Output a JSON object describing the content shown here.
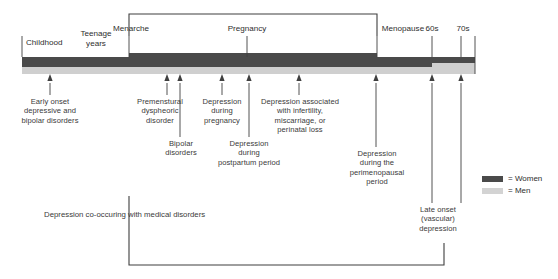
{
  "figure": {
    "colors": {
      "women": "#4a4a4a",
      "men": "#cfcfcf",
      "line": "#3f3f3f",
      "text": "#3a3a3a"
    }
  },
  "stages": [
    {
      "label": "Childhood",
      "x": 50,
      "y": 38,
      "align": "left",
      "tick": false
    },
    {
      "label": "Teenage\nyears",
      "x": 96,
      "y": 28,
      "align": "center",
      "tick": false
    },
    {
      "label": "Menarche",
      "x": 129,
      "y": 24,
      "align": "center",
      "tick": true
    },
    {
      "label": "Pregnancy",
      "x": 247,
      "y": 24,
      "align": "center",
      "tick": true
    },
    {
      "label": "Menopause",
      "x": 377,
      "y": 24,
      "align": "center",
      "tick": true
    },
    {
      "label": "60s",
      "x": 432,
      "y": 24,
      "align": "center",
      "tick": true
    },
    {
      "label": "70s",
      "x": 461,
      "y": 24,
      "align": "center",
      "tick": true
    }
  ],
  "annotations": [
    {
      "text": "Early onset\ndepressive and\nbipolar disorders",
      "x": 50,
      "y": 97,
      "arrow_x": 50,
      "stem_top": 83,
      "stem_bottom": 95
    },
    {
      "text": "Premenstural\ndyspheoric\ndisorder",
      "x": 160,
      "y": 97,
      "arrow_x": 167,
      "stem_top": 83,
      "stem_bottom": 95
    },
    {
      "text": "Bipolar\ndisorders",
      "x": 180,
      "y": 139,
      "arrow_x": 180,
      "stem_top": 83,
      "stem_bottom": 137
    },
    {
      "text": "Depression\nduring\npregnancy",
      "x": 222,
      "y": 97,
      "arrow_x": 222,
      "stem_top": 83,
      "stem_bottom": 95
    },
    {
      "text": "Depression\nduring\npostpartum period",
      "x": 249,
      "y": 139,
      "arrow_x": 249,
      "stem_top": 83,
      "stem_bottom": 137
    },
    {
      "text": "Depression associated\nwith infertility,\nmiscarriage, or\nperinatal loss",
      "x": 299,
      "y": 97,
      "arrow_x": 299,
      "stem_top": 83,
      "stem_bottom": 95
    },
    {
      "text": "Depression\nduring the\nperimenopausal\nperiod",
      "x": 376,
      "y": 149,
      "arrow_x": 376,
      "stem_top": 83,
      "stem_bottom": 147
    },
    {
      "text": "Late onset\n(vascular)\ndepression",
      "x": 432,
      "y": 205,
      "arrow_x": 432,
      "stem_top": 83,
      "stem_bottom": 203
    },
    {
      "text": "",
      "x": 461,
      "y": 205,
      "arrow_x": 461,
      "stem_top": 83,
      "stem_bottom": 203
    }
  ],
  "brackets": {
    "top": {
      "label": "",
      "left_x": 129,
      "right_x": 377,
      "y": 14,
      "drop": 22
    },
    "bottom": {
      "label": "Depression co-occuring with medical disorders",
      "label_x": 44,
      "label_y": 210,
      "left_x": 129,
      "right_x": 444,
      "y": 265,
      "top_y": 196,
      "right_top_y": 243
    }
  },
  "legend": {
    "x": 482,
    "y": 174,
    "items": [
      {
        "label": "= Women",
        "color": "#4a4a4a"
      },
      {
        "label": "= Men",
        "color": "#d3d3d3"
      }
    ]
  },
  "timeline": {
    "start_x": 22,
    "end_x": 475,
    "segments_women": [
      {
        "from": 22,
        "to": 129,
        "top": 57,
        "height": 10
      },
      {
        "from": 129,
        "to": 377,
        "top": 53,
        "height": 14
      },
      {
        "from": 377,
        "to": 432,
        "top": 57,
        "height": 10
      },
      {
        "from": 432,
        "to": 475,
        "top": 57,
        "height": 6
      }
    ],
    "segments_men": [
      {
        "from": 22,
        "to": 377,
        "top": 67,
        "height": 7
      },
      {
        "from": 377,
        "to": 432,
        "top": 67,
        "height": 7
      },
      {
        "from": 432,
        "to": 475,
        "top": 63,
        "height": 11
      }
    ]
  }
}
